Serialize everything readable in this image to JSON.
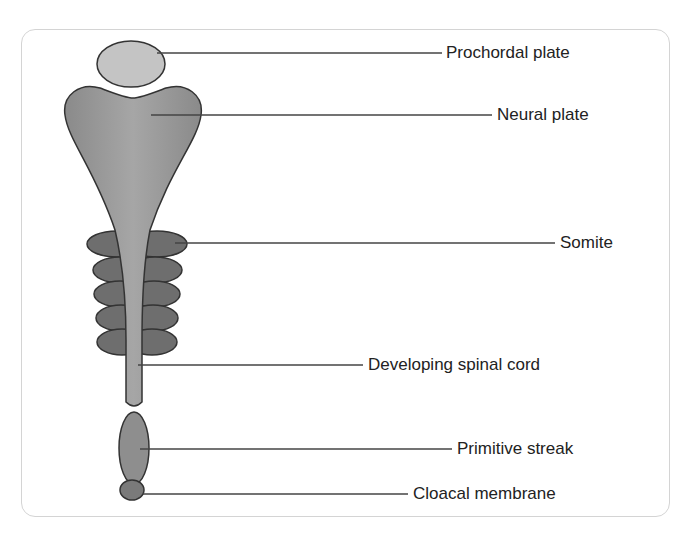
{
  "diagram": {
    "type": "anatomical-labelled-diagram",
    "labels": [
      {
        "id": "prochordal",
        "text": "Prochordal plate"
      },
      {
        "id": "neural",
        "text": "Neural plate"
      },
      {
        "id": "somite",
        "text": "Somite"
      },
      {
        "id": "spinal",
        "text": "Developing spinal cord"
      },
      {
        "id": "streak",
        "text": "Primitive streak"
      },
      {
        "id": "cloacal",
        "text": "Cloacal membrane"
      }
    ],
    "colors": {
      "prochordal_fill": "#c4c4c4",
      "neural_fill": "#9a9a9a",
      "somite_fill": "#6e6e6e",
      "outline": "#333333",
      "leader_line": "#444444",
      "frame_border": "#d4d4d4"
    }
  }
}
